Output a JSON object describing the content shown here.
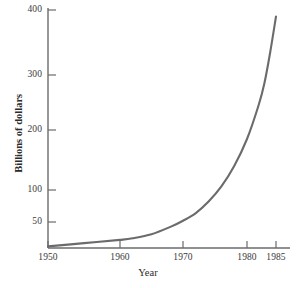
{
  "chart_data": {
    "type": "line",
    "title": "",
    "subtitle": "",
    "xlabel": "Year",
    "ylabel": "Billions of dollars",
    "grid": false,
    "legend": null,
    "legend_position": "none",
    "annotations": [],
    "line_color": "#6b6b6b",
    "axis_color": "#6b6b6b",
    "xlim": [
      1950,
      1986
    ],
    "ylim": [
      18,
      410
    ],
    "y_scale": "nonlinear-compressed",
    "xticks": [
      1950,
      1960,
      1970,
      1980,
      1985
    ],
    "xtick_labels": [
      "1950",
      "1960",
      "1970",
      "1980",
      "1985"
    ],
    "yticks": [
      50,
      100,
      200,
      300,
      400
    ],
    "ytick_labels": [
      "50",
      "100",
      "200",
      "300",
      "400"
    ],
    "x": [
      1950,
      1955,
      1960,
      1962,
      1965,
      1968,
      1970,
      1972,
      1974,
      1976,
      1978,
      1980,
      1982,
      1983,
      1984,
      1985
    ],
    "values": [
      20,
      24,
      28,
      30,
      35,
      44,
      52,
      64,
      82,
      106,
      140,
      185,
      245,
      285,
      335,
      390
    ],
    "series": [
      {
        "name": "Billions of dollars",
        "x": [
          1950,
          1955,
          1960,
          1962,
          1965,
          1968,
          1970,
          1972,
          1974,
          1976,
          1978,
          1980,
          1982,
          1983,
          1984,
          1985
        ],
        "values": [
          20,
          24,
          28,
          30,
          35,
          44,
          52,
          64,
          82,
          106,
          140,
          185,
          245,
          285,
          335,
          390
        ]
      }
    ]
  },
  "axes": {
    "y_ticks": [
      {
        "label": "400",
        "top": 10
      },
      {
        "label": "300",
        "top": 75
      },
      {
        "label": "200",
        "top": 130
      },
      {
        "label": "100",
        "top": 190
      },
      {
        "label": "50",
        "top": 222
      }
    ],
    "x_ticks": [
      {
        "label": "1950",
        "left": 48
      },
      {
        "label": "1960",
        "left": 120
      },
      {
        "label": "1970",
        "left": 183
      },
      {
        "label": "1980",
        "left": 247
      },
      {
        "label": "1985",
        "left": 276
      }
    ],
    "y_axis_title": "Billions of dollars",
    "x_axis_title": "Year"
  },
  "header": {
    "cropped_title": ""
  }
}
